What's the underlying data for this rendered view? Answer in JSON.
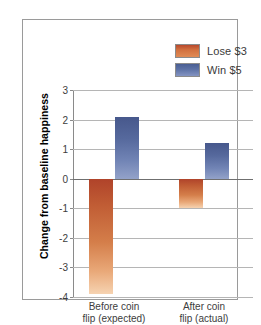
{
  "chart_data": {
    "type": "bar",
    "title": "",
    "xlabel": "",
    "ylabel": "Change from baseline happiness",
    "categories": [
      "Before coin flip (expected)",
      "After coin flip (actual)"
    ],
    "category_lines": [
      [
        "Before coin",
        "flip (expected)"
      ],
      [
        "After coin",
        "flip (actual)"
      ]
    ],
    "series": [
      {
        "name": "Lose $3",
        "color": "#c05c34",
        "values": [
          -3.9,
          -1.0
        ]
      },
      {
        "name": "Win $5",
        "color": "#56699d",
        "values": [
          2.1,
          1.2
        ]
      }
    ],
    "ylim": [
      -4,
      3
    ],
    "yticks": [
      3,
      2,
      1,
      0,
      -1,
      -2,
      -3,
      -4
    ],
    "ytick_labels": [
      "3",
      "2",
      "1",
      "0",
      "-1",
      "-2",
      "-3",
      "-4"
    ],
    "grid": true,
    "legend_position": "top-right"
  },
  "legend": {
    "items": [
      {
        "label": "Lose $3",
        "swatch": "lose"
      },
      {
        "label": "Win $5",
        "swatch": "win"
      }
    ]
  }
}
